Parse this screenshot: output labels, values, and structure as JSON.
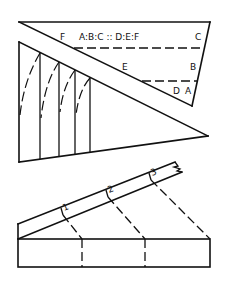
{
  "diagram": {
    "top_figure": {
      "proportion_label": "A:B:C :: D:E:F",
      "labels": {
        "F": "F",
        "C": "C",
        "E": "E",
        "B": "B",
        "D": "D",
        "A": "A"
      }
    },
    "bottom_figure": {
      "division_marks": [
        "1",
        "2",
        "3"
      ]
    },
    "colors": {
      "line": "#111111",
      "background": "#ffffff"
    }
  }
}
